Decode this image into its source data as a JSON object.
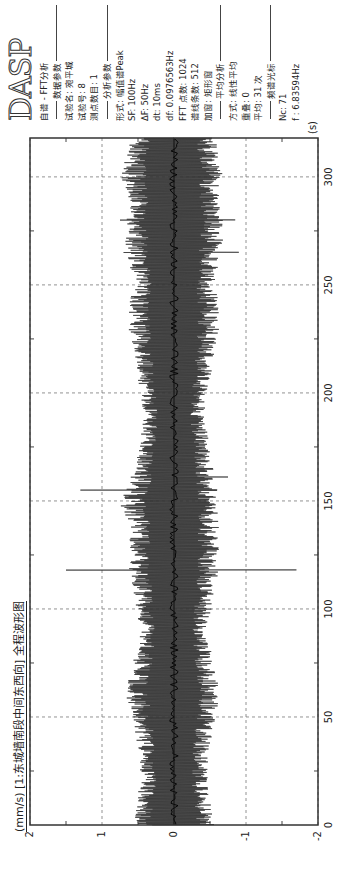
{
  "panel": {
    "logo": "DASP",
    "lines": [
      {
        "type": "text",
        "text": "自谱 - FFT分析"
      },
      {
        "type": "sep",
        "text": "数据参数"
      },
      {
        "type": "text",
        "text": "试验名: 宛平城"
      },
      {
        "type": "text",
        "text": "试验号: 8"
      },
      {
        "type": "text",
        "text": "测点数目: 1"
      },
      {
        "type": "sep",
        "text": "分析参数"
      },
      {
        "type": "text",
        "text": "形式: 幅值谱Peak"
      },
      {
        "type": "text",
        "text": "SF: 100Hz"
      },
      {
        "type": "text",
        "text": "ΔF: 50Hz"
      },
      {
        "type": "text",
        "text": "dt: 10ms"
      },
      {
        "type": "text",
        "text": "df: 0.0976563Hz"
      },
      {
        "type": "text",
        "text": "FFT 点数: 1024"
      },
      {
        "type": "text",
        "text": "谱线条数: 512"
      },
      {
        "type": "text",
        "text": "加窗: 矩形窗"
      },
      {
        "type": "sep",
        "text": "平均分析"
      },
      {
        "type": "text",
        "text": "方式: 线性平均"
      },
      {
        "type": "text",
        "text": "重叠: 0"
      },
      {
        "type": "text",
        "text": "平均: 31 次"
      },
      {
        "type": "sep",
        "text": "频谱光标"
      },
      {
        "type": "text",
        "text": "Nc: 71"
      },
      {
        "type": "text",
        "text": "f : 6.83594Hz"
      }
    ]
  },
  "chart_data": {
    "type": "line",
    "title": "(mm/s) [1:东城墙南段中间东西向] 全程波形图",
    "ylabel": "(mm/s)",
    "xlabel": "(s)",
    "xlim": [
      0,
      318
    ],
    "ylim": [
      -2,
      2
    ],
    "xticks": [
      0,
      50,
      100,
      150,
      200,
      250,
      300
    ],
    "yticks": [
      2,
      1,
      0,
      -1,
      -2
    ],
    "grid": true,
    "series": [
      {
        "name": "1:东城墙南段中间东西向",
        "envelope_step_s": 10,
        "envelope_pos": [
          0.55,
          0.5,
          0.45,
          0.45,
          0.5,
          0.55,
          0.65,
          0.6,
          0.5,
          0.45,
          0.5,
          0.55,
          0.6,
          0.6,
          0.6,
          0.75,
          0.55,
          0.5,
          0.45,
          0.4,
          0.45,
          0.5,
          0.55,
          0.6,
          0.6,
          0.55,
          0.6,
          0.65,
          0.65,
          0.6,
          0.7,
          0.65
        ],
        "envelope_neg": [
          -0.55,
          -0.5,
          -0.45,
          -0.45,
          -0.5,
          -0.55,
          -0.65,
          -0.55,
          -0.5,
          -0.45,
          -0.5,
          -0.55,
          -0.6,
          -0.6,
          -0.6,
          -0.6,
          -0.55,
          -0.5,
          -0.45,
          -0.4,
          -0.45,
          -0.5,
          -0.55,
          -0.6,
          -0.6,
          -0.55,
          -0.6,
          -0.65,
          -0.65,
          -0.6,
          -0.65,
          -0.6
        ],
        "spikes": [
          {
            "t": 118,
            "min": -1.7,
            "max": 1.5
          },
          {
            "t": 155,
            "min": -0.6,
            "max": 1.3
          },
          {
            "t": 161,
            "min": -0.75,
            "max": 0.6
          },
          {
            "t": 265,
            "min": -0.9,
            "max": 0.7
          },
          {
            "t": 280,
            "min": -0.85,
            "max": 0.75
          }
        ]
      }
    ]
  }
}
